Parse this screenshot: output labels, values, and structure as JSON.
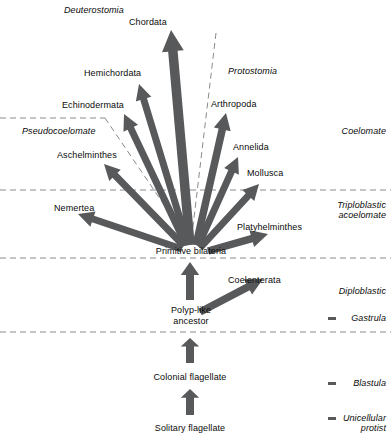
{
  "diagram": {
    "colors": {
      "arrow": "#58595B",
      "dashed_line": "#8a8a8a",
      "text": "#0a0a0a",
      "background": "#ffffff"
    }
  },
  "taxa": [
    {
      "id": "chordata",
      "label": "Chordata",
      "x": 129,
      "y": 17
    },
    {
      "id": "hemichordata",
      "label": "Hemichordata",
      "x": 84,
      "y": 68
    },
    {
      "id": "echinodermata",
      "label": "Echinodermata",
      "x": 62,
      "y": 100
    },
    {
      "id": "aschelminthes",
      "label": "Aschelminthes",
      "x": 57,
      "y": 150
    },
    {
      "id": "nemertea",
      "label": "Nemertea",
      "x": 54,
      "y": 203
    },
    {
      "id": "arthropoda",
      "label": "Arthropoda",
      "x": 211,
      "y": 99
    },
    {
      "id": "annelida",
      "label": "Annelida",
      "x": 233,
      "y": 142
    },
    {
      "id": "mollusca",
      "label": "Mollusca",
      "x": 247,
      "y": 168
    },
    {
      "id": "platyhelminthes",
      "label": "Platyhelminthes",
      "x": 237,
      "y": 222
    },
    {
      "id": "coelenterata",
      "label": "Coelenterata",
      "x": 228,
      "y": 275
    }
  ],
  "ancestors": [
    {
      "id": "primitive-bilateria",
      "label": "Primitive bilateria",
      "x": 146,
      "y": 246,
      "w": 90
    },
    {
      "id": "polyp-like-ancestor",
      "label": "Polyp-like\nancestor",
      "x": 158,
      "y": 305,
      "w": 66
    },
    {
      "id": "colonial-flagellate",
      "label": "Colonial flagellate",
      "x": 140,
      "y": 372,
      "w": 100
    },
    {
      "id": "solitary-flagellate",
      "label": "Solitary flagellate",
      "x": 140,
      "y": 423,
      "w": 100
    }
  ],
  "regions": [
    {
      "id": "deuterostomia",
      "label": "Deuterostomia",
      "x": 64,
      "y": 5
    },
    {
      "id": "protostomia",
      "label": "Protostomia",
      "x": 228,
      "y": 66
    },
    {
      "id": "pseudocoelomate",
      "label": "Pseudocoelomate",
      "x": 22,
      "y": 126
    }
  ],
  "grade_labels": [
    {
      "id": "coelomate",
      "label": "Coelomate",
      "x": 298,
      "y": 126,
      "w": 88,
      "tick": false
    },
    {
      "id": "triploblastic-acoelomate",
      "label": "Triploblastic\nacoelomate",
      "x": 298,
      "y": 200,
      "w": 88,
      "tick": false
    },
    {
      "id": "diploblastic",
      "label": "Diploblastic",
      "x": 298,
      "y": 286,
      "w": 88,
      "tick": false
    },
    {
      "id": "gastrula",
      "label": "Gastrula",
      "x": 298,
      "y": 313,
      "w": 88,
      "tick": true
    },
    {
      "id": "blastula",
      "label": "Blastula",
      "x": 298,
      "y": 378,
      "w": 88,
      "tick": true
    },
    {
      "id": "unicellular-protist",
      "label": "Unicellular\nprotist",
      "x": 298,
      "y": 413,
      "w": 88,
      "tick": true
    }
  ],
  "arrows": [
    {
      "id": "arrow-chordata",
      "from": [
        190,
        245
      ],
      "to": [
        171,
        30
      ],
      "width": 9.5
    },
    {
      "id": "arrow-hemichordata",
      "from": [
        188,
        245
      ],
      "to": [
        139,
        84
      ],
      "width": 7.0
    },
    {
      "id": "arrow-echinodermata",
      "from": [
        186,
        245
      ],
      "to": [
        124,
        114
      ],
      "width": 7.0
    },
    {
      "id": "arrow-aschelminthes",
      "from": [
        184,
        246
      ],
      "to": [
        104,
        164
      ],
      "width": 7.0
    },
    {
      "id": "arrow-nemertea",
      "from": [
        182,
        249
      ],
      "to": [
        78,
        214
      ],
      "width": 7.0
    },
    {
      "id": "arrow-arthropoda",
      "from": [
        196,
        245
      ],
      "to": [
        226,
        113
      ],
      "width": 7.5
    },
    {
      "id": "arrow-annelida",
      "from": [
        198,
        246
      ],
      "to": [
        238,
        157
      ],
      "width": 7.0
    },
    {
      "id": "arrow-mollusca",
      "from": [
        200,
        248
      ],
      "to": [
        259,
        184
      ],
      "width": 7.0
    },
    {
      "id": "arrow-platyhelminthes",
      "from": [
        208,
        251
      ],
      "to": [
        268,
        234
      ],
      "width": 7.5
    },
    {
      "id": "arrow-coelenterata",
      "from": [
        200,
        312
      ],
      "to": [
        263,
        279
      ],
      "width": 7.5
    },
    {
      "id": "arrow-polyp-to-bilateria",
      "from": [
        190,
        300
      ],
      "to": [
        190,
        262
      ],
      "width": 8.0
    },
    {
      "id": "arrow-colonial-to-polyp",
      "from": [
        190,
        363
      ],
      "to": [
        190,
        338
      ],
      "width": 8.0
    },
    {
      "id": "arrow-solitary-to-colonial",
      "from": [
        190,
        415
      ],
      "to": [
        190,
        389
      ],
      "width": 8.0
    }
  ],
  "dashed_lines": [
    {
      "id": "divider-coelomate-top",
      "points": "0,118 105,118"
    },
    {
      "id": "divider-pseudocoelomate-diag",
      "points": "105,118 190,243"
    },
    {
      "id": "divider-triploblastic",
      "points": "0,190 391,190"
    },
    {
      "id": "divider-diploblastic",
      "points": "0,258 391,258"
    },
    {
      "id": "divider-blastula",
      "points": "0,332 391,332"
    },
    {
      "id": "divider-protostomia-diag",
      "points": "216,33 191,243"
    }
  ]
}
